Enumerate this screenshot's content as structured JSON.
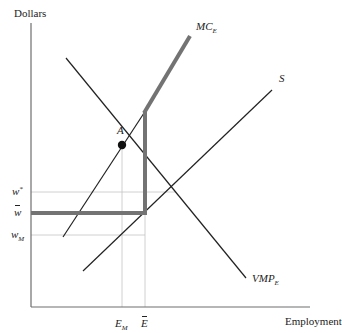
{
  "diagram": {
    "type": "labor-market-monopsony-minimum-wage",
    "axes": {
      "y_label": "Dollars",
      "x_label": "Employment"
    },
    "curves": [
      {
        "name": "MC",
        "sub": "E",
        "label": "MC_E"
      },
      {
        "name": "S",
        "sub": "",
        "label": "S"
      },
      {
        "name": "VMP",
        "sub": "E",
        "label": "VMP_E"
      }
    ],
    "point": {
      "label": "A"
    },
    "y_ticks": [
      {
        "main": "w",
        "mark": "*",
        "label": "w*"
      },
      {
        "main": "w",
        "mark": "bar",
        "label": "w̄"
      },
      {
        "main": "w",
        "sub": "M",
        "label": "w_M"
      }
    ],
    "x_ticks": [
      {
        "main": "E",
        "sub": "M",
        "label": "E_M"
      },
      {
        "main": "E",
        "mark": "bar",
        "label": "Ē"
      }
    ],
    "colors": {
      "axis": "#6e6e6e",
      "thin_line": "#222222",
      "thick_line": "#737373",
      "guide": "#bdbdbd",
      "point": "#111111"
    }
  }
}
